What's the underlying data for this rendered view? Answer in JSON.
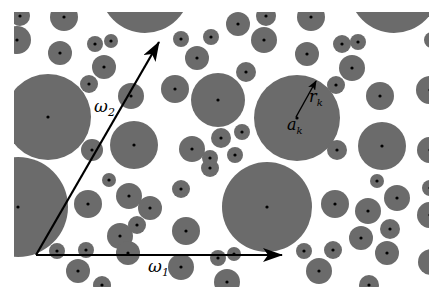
{
  "figure": {
    "clip": {
      "x": 14,
      "y": 12,
      "width": 415,
      "height": 275
    },
    "colors": {
      "disk_fill": "#6b6b6b",
      "center_dot": "#000000",
      "vector": "#000000",
      "background": "#ffffff"
    },
    "labels": {
      "omega1": "ω",
      "omega1_sub": "1",
      "omega2": "ω",
      "omega2_sub": "2",
      "radius": "r",
      "radius_sub": "k",
      "center": "a",
      "center_sub": "k"
    },
    "vectors": [
      {
        "name": "omega1",
        "from": [
          36,
          255
        ],
        "to": [
          282,
          255
        ]
      },
      {
        "name": "omega2",
        "from": [
          36,
          255
        ],
        "to": [
          159,
          42
        ]
      },
      {
        "name": "radius",
        "from": [
          296,
          117
        ],
        "to": [
          316,
          81
        ]
      }
    ],
    "disks": [
      [
        20,
        16,
        10
      ],
      [
        64,
        17,
        14
      ],
      [
        17,
        40,
        14
      ],
      [
        60,
        53,
        12
      ],
      [
        95,
        44,
        8
      ],
      [
        111,
        41,
        7
      ],
      [
        104,
        67,
        12
      ],
      [
        145,
        -12,
        45
      ],
      [
        181,
        39,
        8
      ],
      [
        211,
        37,
        8
      ],
      [
        197,
        58,
        12
      ],
      [
        238,
        24,
        12
      ],
      [
        266,
        16,
        10
      ],
      [
        264,
        40,
        13
      ],
      [
        311,
        17,
        14
      ],
      [
        307,
        54,
        12
      ],
      [
        246,
        72,
        10
      ],
      [
        394,
        -12,
        45
      ],
      [
        342,
        44,
        9
      ],
      [
        358,
        42,
        8
      ],
      [
        352,
        68,
        13
      ],
      [
        336,
        85,
        9
      ],
      [
        380,
        96,
        14
      ],
      [
        430,
        90,
        14
      ],
      [
        432,
        40,
        8
      ],
      [
        48,
        117,
        43
      ],
      [
        89,
        84,
        9
      ],
      [
        131,
        96,
        13
      ],
      [
        134,
        145,
        24
      ],
      [
        92,
        150,
        11
      ],
      [
        175,
        89,
        14
      ],
      [
        218,
        100,
        27
      ],
      [
        221,
        138,
        10
      ],
      [
        242,
        132,
        8
      ],
      [
        192,
        149,
        13
      ],
      [
        235,
        155,
        8
      ],
      [
        210,
        168,
        9
      ],
      [
        297,
        118,
        43
      ],
      [
        382,
        146,
        24
      ],
      [
        377,
        181,
        7
      ],
      [
        337,
        150,
        10
      ],
      [
        430,
        150,
        13
      ],
      [
        18,
        207,
        50
      ],
      [
        88,
        204,
        14
      ],
      [
        129,
        196,
        13
      ],
      [
        109,
        180,
        7
      ],
      [
        120,
        236,
        13
      ],
      [
        137,
        225,
        9
      ],
      [
        150,
        208,
        12
      ],
      [
        57,
        251,
        8
      ],
      [
        86,
        250,
        8
      ],
      [
        78,
        271,
        12
      ],
      [
        128,
        253,
        12
      ],
      [
        102,
        285,
        9
      ],
      [
        181,
        189,
        9
      ],
      [
        186,
        231,
        14
      ],
      [
        181,
        267,
        13
      ],
      [
        218,
        258,
        8
      ],
      [
        234,
        254,
        7
      ],
      [
        227,
        282,
        13
      ],
      [
        210,
        158,
        8
      ],
      [
        267,
        207,
        45
      ],
      [
        335,
        204,
        14
      ],
      [
        368,
        211,
        13
      ],
      [
        397,
        198,
        13
      ],
      [
        390,
        229,
        10
      ],
      [
        361,
        238,
        12
      ],
      [
        387,
        253,
        12
      ],
      [
        304,
        251,
        8
      ],
      [
        333,
        250,
        9
      ],
      [
        319,
        271,
        13
      ],
      [
        369,
        285,
        10
      ],
      [
        430,
        215,
        13
      ],
      [
        431,
        262,
        13
      ],
      [
        430,
        188,
        8
      ]
    ]
  }
}
